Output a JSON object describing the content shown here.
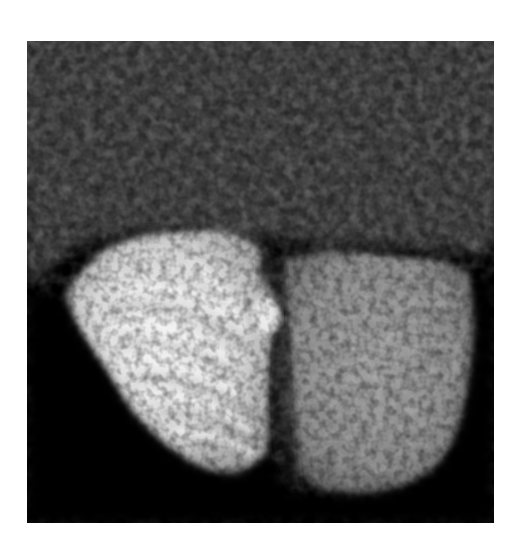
{
  "image": {
    "kind": "grayscale medical scan",
    "description": "Axial-style grayscale scan showing two bright lobes (left brighter with striated folia, right dimmer and more uniform) above a dark lower region, with speckled noisy tissue in the upper half",
    "colors": {
      "page_background": "#ffffff",
      "scan_background": "#000000",
      "noise_mid": "#3a3a3a",
      "left_lobe": "#d8d8d8",
      "left_lobe_highlight": "#f2f2f2",
      "right_lobe": "#8a8a8a",
      "midline_dark": "#1a1a1a"
    },
    "frame": {
      "x": 27,
      "y": 41,
      "width": 467,
      "height": 482
    }
  }
}
